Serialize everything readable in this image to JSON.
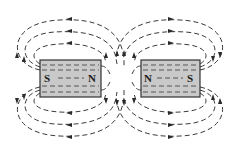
{
  "diagram": {
    "title": "",
    "colors": {
      "background": "#ffffff",
      "magnet_fill": "#c9c9c9",
      "line": "#3a3a3a"
    },
    "magnets": [
      {
        "id": "left-magnet",
        "left_pole": "S",
        "right_pole": "N"
      },
      {
        "id": "right-magnet",
        "left_pole": "N",
        "right_pole": "S"
      }
    ],
    "field_line_style": "dashed with arrowheads"
  }
}
